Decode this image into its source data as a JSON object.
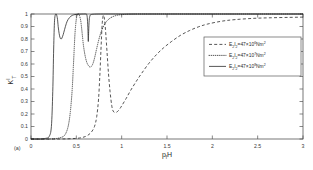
{
  "figure": {
    "panel_label": "(a)",
    "background_color": "#ffffff",
    "line_color": "#1d1d1d"
  },
  "axes": {
    "y_label_main": "K",
    "y_label_sub": "T",
    "y_label_sup": "I",
    "x_label_main": "p",
    "x_label_sub": "f",
    "x_label_tail": "H",
    "x_ticks": [
      "0",
      "0.5",
      "1",
      "1.5",
      "2",
      "2.5",
      "3"
    ],
    "y_ticks": [
      "0",
      "0.1",
      "0.2",
      "0.3",
      "0.4",
      "0.5",
      "0.6",
      "0.7",
      "0.8",
      "0.9",
      "1"
    ]
  },
  "legend": {
    "position": "upper-right",
    "entries": [
      {
        "style": "dashed",
        "prefix": "E",
        "sub1": "2",
        "mid": "I",
        "sub2": "2",
        "eq": "=47×10",
        "exponent": "6",
        "unit": "Nm",
        "unit_sup": "2",
        "full_text": "E2I2=47×10^6 Nm^2"
      },
      {
        "style": "dotted",
        "prefix": "E",
        "sub1": "2",
        "mid": "I",
        "sub2": "2",
        "eq": "=47×10",
        "exponent": "7",
        "unit": "Nm",
        "unit_sup": "2",
        "full_text": "E2I2=47×10^7 Nm^2"
      },
      {
        "style": "solid",
        "prefix": "E",
        "sub1": "2",
        "mid": "I",
        "sub2": "2",
        "eq": "=47×10",
        "exponent": "8",
        "unit": "Nm",
        "unit_sup": "2",
        "full_text": "E2I2=47×10^8 Nm^2"
      }
    ]
  },
  "chart_data": {
    "type": "line",
    "title": "",
    "subtitle": "",
    "xlabel": "p_f H",
    "ylabel": "K_T^I",
    "xlim": [
      0,
      3
    ],
    "ylim": [
      0,
      1
    ],
    "xticks": [
      0,
      0.5,
      1,
      1.5,
      2,
      2.5,
      3
    ],
    "yticks": [
      0,
      0.1,
      0.2,
      0.3,
      0.4,
      0.5,
      0.6,
      0.7,
      0.8,
      0.9,
      1
    ],
    "grid": false,
    "legend_position": "upper right",
    "annotations": [
      {
        "text": "(a)",
        "x": 0.02,
        "y": -0.055
      }
    ],
    "series": [
      {
        "name": "E2I2=47×10^8 Nm^2",
        "style": "solid",
        "x": [
          0.0,
          0.1,
          0.16,
          0.2,
          0.225,
          0.24,
          0.25,
          0.26,
          0.275,
          0.29,
          0.3,
          0.31,
          0.32,
          0.33,
          0.34,
          0.355,
          0.37,
          0.39,
          0.41,
          0.44,
          0.47,
          0.5,
          0.54,
          0.58,
          0.605,
          0.615,
          0.622,
          0.628,
          0.632,
          0.636,
          0.642,
          0.65,
          0.66,
          0.7,
          0.8,
          1.0,
          1.4,
          2.0,
          2.5,
          3.0
        ],
        "y": [
          0.0,
          0.0,
          0.005,
          0.02,
          0.1,
          0.38,
          0.72,
          0.95,
          1.0,
          0.97,
          0.9,
          0.845,
          0.812,
          0.8,
          0.806,
          0.835,
          0.875,
          0.925,
          0.957,
          0.982,
          0.993,
          0.997,
          0.999,
          1.0,
          1.0,
          0.995,
          0.96,
          0.87,
          0.78,
          0.86,
          0.95,
          0.985,
          0.995,
          0.999,
          1.0,
          1.0,
          1.0,
          1.0,
          1.0,
          1.0
        ]
      },
      {
        "name": "E2I2=47×10^7 Nm^2",
        "style": "dotted",
        "x": [
          0.0,
          0.2,
          0.32,
          0.38,
          0.42,
          0.45,
          0.47,
          0.485,
          0.5,
          0.515,
          0.53,
          0.545,
          0.555,
          0.565,
          0.58,
          0.6,
          0.62,
          0.645,
          0.665,
          0.685,
          0.705,
          0.725,
          0.75,
          0.78,
          0.82,
          0.86,
          0.9,
          0.95,
          1.0,
          1.1,
          1.3,
          1.7,
          2.2,
          2.6,
          3.0
        ],
        "y": [
          0.0,
          0.0,
          0.01,
          0.04,
          0.14,
          0.35,
          0.62,
          0.84,
          0.96,
          1.0,
          0.995,
          0.96,
          0.91,
          0.84,
          0.74,
          0.655,
          0.605,
          0.578,
          0.58,
          0.607,
          0.66,
          0.725,
          0.8,
          0.87,
          0.928,
          0.96,
          0.978,
          0.99,
          0.995,
          0.999,
          1.0,
          1.0,
          1.0,
          1.0,
          1.0
        ]
      },
      {
        "name": "E2I2=47×10^6 Nm^2",
        "style": "dashed",
        "x": [
          0.0,
          0.3,
          0.5,
          0.6,
          0.66,
          0.7,
          0.725,
          0.745,
          0.76,
          0.772,
          0.782,
          0.79,
          0.8,
          0.812,
          0.825,
          0.84,
          0.855,
          0.872,
          0.89,
          0.905,
          0.925,
          0.945,
          0.97,
          1.0,
          1.05,
          1.1,
          1.16,
          1.22,
          1.3,
          1.38,
          1.46,
          1.55,
          1.65,
          1.75,
          1.85,
          1.95,
          2.1,
          2.25,
          2.45,
          2.65,
          2.85,
          3.0
        ],
        "y": [
          0.0,
          0.0,
          0.005,
          0.02,
          0.05,
          0.1,
          0.18,
          0.32,
          0.52,
          0.72,
          0.88,
          0.96,
          0.99,
          0.95,
          0.84,
          0.68,
          0.52,
          0.38,
          0.27,
          0.225,
          0.212,
          0.215,
          0.232,
          0.265,
          0.325,
          0.39,
          0.46,
          0.525,
          0.605,
          0.672,
          0.728,
          0.78,
          0.83,
          0.868,
          0.898,
          0.92,
          0.942,
          0.955,
          0.965,
          0.97,
          0.973,
          0.975
        ]
      }
    ]
  }
}
